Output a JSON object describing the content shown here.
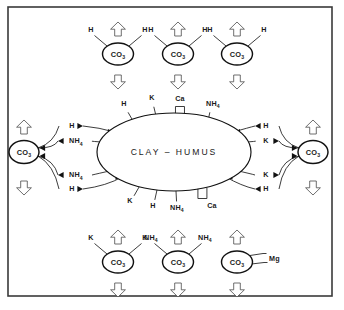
{
  "figure": {
    "core_label": "CLAY – HUMUS",
    "frame_color": "#3a3a3a",
    "ink_color": "#111111",
    "background": "#ffffff",
    "hollow_arrow_color": "#4a4a4a"
  },
  "core": {
    "label": "CLAY – HUMUS",
    "cx": 174,
    "cy": 152,
    "rx": 77,
    "ry": 39,
    "top_ions": [
      {
        "name": "H",
        "sub": "",
        "x": 124,
        "y": 106,
        "bond_x": 133,
        "bond_y": 120,
        "valence": 1
      },
      {
        "name": "K",
        "sub": "",
        "x": 152,
        "y": 100,
        "bond_x": 156,
        "bond_y": 115,
        "valence": 1
      },
      {
        "name": "Ca",
        "sub": "",
        "x": 180,
        "y": 101,
        "bond_x": 180,
        "bond_y": 113,
        "valence": 2
      },
      {
        "name": "NH",
        "sub": "4",
        "x": 213,
        "y": 106,
        "bond_x": 206,
        "bond_y": 120,
        "valence": 1
      }
    ],
    "bottom_ions": [
      {
        "name": "K",
        "sub": "",
        "x": 130,
        "y": 203,
        "bond_x": 139,
        "bond_y": 187,
        "valence": 1
      },
      {
        "name": "H",
        "sub": "",
        "x": 153,
        "y": 208,
        "bond_x": 157,
        "bond_y": 190,
        "valence": 1
      },
      {
        "name": "NH",
        "sub": "4",
        "x": 177,
        "y": 210,
        "bond_x": 176,
        "bond_y": 191,
        "valence": 1
      },
      {
        "name": "Ca",
        "sub": "",
        "x": 212,
        "y": 208,
        "bond_x": 203,
        "bond_y": 189,
        "valence": 2
      }
    ]
  },
  "nodes": {
    "top_row": [
      {
        "id": "top-1",
        "label": "CO",
        "sub": "3",
        "cx": 118,
        "cy": 54,
        "ligands": [
          {
            "name": "H",
            "sub": "",
            "side": "left"
          },
          {
            "name": "H",
            "sub": "",
            "side": "right"
          }
        ]
      },
      {
        "id": "top-2",
        "label": "CO",
        "sub": "3",
        "cx": 178,
        "cy": 54,
        "ligands": [
          {
            "name": "H",
            "sub": "",
            "side": "left"
          },
          {
            "name": "H",
            "sub": "",
            "side": "right"
          }
        ]
      },
      {
        "id": "top-3",
        "label": "CO",
        "sub": "3",
        "cx": 237,
        "cy": 54,
        "ligands": [
          {
            "name": "H",
            "sub": "",
            "side": "left"
          },
          {
            "name": "H",
            "sub": "",
            "side": "right"
          }
        ]
      }
    ],
    "bottom_row": [
      {
        "id": "bot-1",
        "label": "CO",
        "sub": "3",
        "cx": 118,
        "cy": 262,
        "ligands": [
          {
            "name": "K",
            "sub": "",
            "side": "left"
          },
          {
            "name": "K",
            "sub": "",
            "side": "right"
          }
        ]
      },
      {
        "id": "bot-2",
        "label": "CO",
        "sub": "3",
        "cx": 178,
        "cy": 262,
        "ligands": [
          {
            "name": "NH",
            "sub": "4",
            "side": "left"
          },
          {
            "name": "NH",
            "sub": "4",
            "side": "right"
          }
        ]
      },
      {
        "id": "bot-3",
        "label": "CO",
        "sub": "3",
        "cx": 237,
        "cy": 262,
        "ligands": [
          {
            "name": "Mg",
            "sub": "",
            "side": "right-divalent"
          }
        ]
      }
    ],
    "left": {
      "id": "left-1",
      "label": "CO",
      "sub": "3",
      "cx": 24,
      "cy": 152
    },
    "right": {
      "id": "right-1",
      "label": "CO",
      "sub": "3",
      "cx": 313,
      "cy": 152
    }
  },
  "exchange_arrows": {
    "left_side": [
      {
        "name": "H",
        "sub": "",
        "x": 72,
        "y": 126,
        "direction": "to-core"
      },
      {
        "name": "NH",
        "sub": "4",
        "x": 76,
        "y": 141,
        "direction": "to-node"
      },
      {
        "name": "NH",
        "sub": "4",
        "x": 76,
        "y": 175,
        "direction": "to-node"
      },
      {
        "name": "H",
        "sub": "",
        "x": 72,
        "y": 189,
        "direction": "to-core"
      }
    ],
    "right_side": [
      {
        "name": "H",
        "sub": "",
        "x": 266,
        "y": 126,
        "direction": "to-core"
      },
      {
        "name": "K",
        "sub": "",
        "x": 266,
        "y": 141,
        "direction": "to-node"
      },
      {
        "name": "K",
        "sub": "",
        "x": 266,
        "y": 175,
        "direction": "to-node"
      },
      {
        "name": "H",
        "sub": "",
        "x": 266,
        "y": 189,
        "direction": "to-core"
      }
    ]
  },
  "hollow_arrows": {
    "top_row_up": [
      {
        "x": 118,
        "y": 22
      },
      {
        "x": 178,
        "y": 22
      },
      {
        "x": 237,
        "y": 22
      }
    ],
    "top_row_down": [
      {
        "x": 118,
        "y": 75
      },
      {
        "x": 178,
        "y": 75
      },
      {
        "x": 237,
        "y": 75
      }
    ],
    "bottom_row_up": [
      {
        "x": 118,
        "y": 230
      },
      {
        "x": 178,
        "y": 230
      },
      {
        "x": 237,
        "y": 230
      }
    ],
    "bottom_row_down": [
      {
        "x": 118,
        "y": 283
      },
      {
        "x": 178,
        "y": 283
      },
      {
        "x": 237,
        "y": 283
      }
    ],
    "left_up": {
      "x": 24,
      "y": 120
    },
    "left_down": {
      "x": 24,
      "y": 181
    },
    "right_up": {
      "x": 313,
      "y": 120
    },
    "right_down": {
      "x": 313,
      "y": 181
    }
  },
  "frame": {
    "x": 8,
    "y": 7,
    "width": 324,
    "height": 289
  }
}
